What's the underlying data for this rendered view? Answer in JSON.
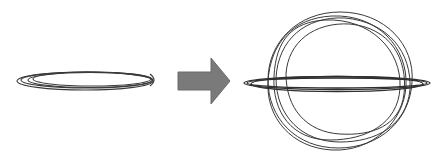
{
  "diagram": {
    "left": {
      "label": "",
      "shape": "flattened-ellipses",
      "count": 4
    },
    "arrow": {
      "direction": "right",
      "color": "#7a7a7a"
    },
    "right": {
      "label": "",
      "shape": "irregular-circles-with-flat-ellipses",
      "circle_count": 5,
      "ellipse_count": 3
    },
    "colors": {
      "stroke": "#3a3a3a",
      "background": "#ffffff",
      "arrow": "#7a7a7a"
    }
  }
}
